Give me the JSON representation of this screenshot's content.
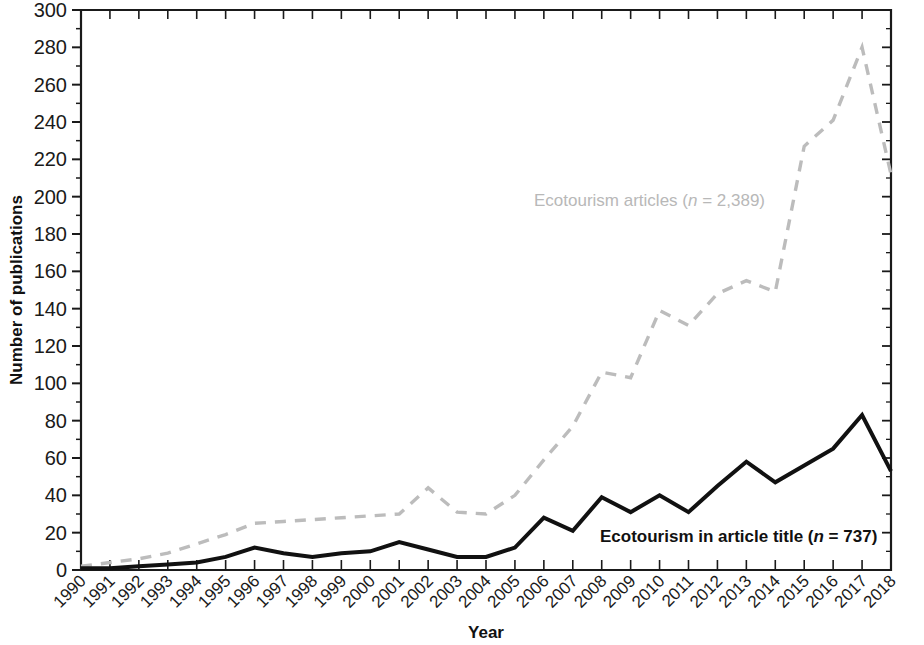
{
  "chart_data": {
    "type": "line",
    "title": "",
    "xlabel": "Year",
    "ylabel": "Number of publications",
    "xlim": [
      1990,
      2018
    ],
    "ylim": [
      0,
      300
    ],
    "y_major_step": 20,
    "y_minor_step": 10,
    "grid": false,
    "legend_position": "inline-annotations",
    "categories": [
      "1990",
      "1991",
      "1992",
      "1993",
      "1994",
      "1995",
      "1996",
      "1997",
      "1998",
      "1999",
      "2000",
      "2001",
      "2002",
      "2003",
      "2004",
      "2005",
      "2006",
      "2007",
      "2008",
      "2009",
      "2010",
      "2011",
      "2012",
      "2013",
      "2014",
      "2015",
      "2016",
      "2017",
      "2018"
    ],
    "x": [
      1990,
      1991,
      1992,
      1993,
      1994,
      1995,
      1996,
      1997,
      1998,
      1999,
      2000,
      2001,
      2002,
      2003,
      2004,
      2005,
      2006,
      2007,
      2008,
      2009,
      2010,
      2011,
      2012,
      2013,
      2014,
      2015,
      2016,
      2017,
      2018
    ],
    "series": [
      {
        "name": "Ecotourism articles",
        "style": "dashed",
        "color": "#bcbcbc",
        "total_n": "2,389",
        "values": [
          2,
          4,
          6,
          9,
          14,
          19,
          25,
          26,
          27,
          28,
          29,
          30,
          44,
          31,
          30,
          40,
          59,
          77,
          106,
          103,
          139,
          131,
          148,
          155,
          149,
          227,
          241,
          280,
          212
        ]
      },
      {
        "name": "Ecotourism in article title",
        "style": "solid",
        "color": "#111111",
        "total_n": "737",
        "values": [
          1,
          1,
          2,
          3,
          4,
          7,
          12,
          9,
          7,
          9,
          10,
          15,
          11,
          7,
          7,
          12,
          28,
          21,
          39,
          31,
          40,
          31,
          45,
          58,
          47,
          56,
          65,
          83,
          53
        ]
      }
    ],
    "annotations": [
      {
        "id": "gray-series-label",
        "text_prefix": "Ecotourism articles (",
        "text_italic": "n",
        "text_suffix": " = 2,389)",
        "color": "#b8b8b8",
        "x_px": 534,
        "y_px": 206
      },
      {
        "id": "black-series-label",
        "text_prefix": "Ecotourism in article title (",
        "text_italic": "n",
        "text_suffix": " = 737)",
        "color": "#111111",
        "x_px": 600,
        "y_px": 542
      }
    ],
    "y_tick_labels": [
      "0",
      "20",
      "40",
      "60",
      "80",
      "100",
      "120",
      "140",
      "160",
      "180",
      "200",
      "220",
      "240",
      "260",
      "280",
      "300"
    ]
  },
  "figure": {
    "axis_color": "#1a1a1a",
    "background": "#ffffff"
  }
}
